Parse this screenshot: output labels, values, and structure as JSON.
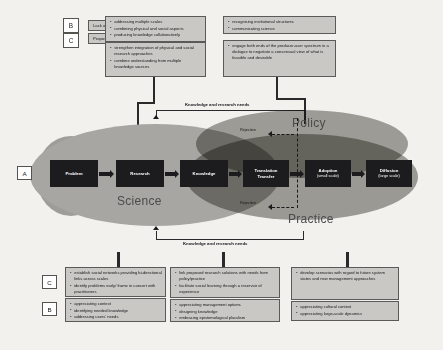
{
  "legend": {
    "rows": [
      {
        "letter": "B",
        "text": "Lack of..."
      },
      {
        "letter": "C",
        "text": "Proposed to..."
      }
    ]
  },
  "side_labels": {
    "a": "A",
    "c": "C",
    "b": "B"
  },
  "top_boxes": [
    {
      "id": "top-left-b",
      "items": [
        "addressing multiple scales",
        "combining physical and social aspects",
        "producing knowledge collaboratively"
      ]
    },
    {
      "id": "top-left-c",
      "items": [
        "strengthen integration of physical and social research approaches",
        "combine understanding from multiple knowledge sources"
      ]
    },
    {
      "id": "top-right-b",
      "items": [
        "recognising institutional structures",
        "communicating science"
      ]
    },
    {
      "id": "top-right-c",
      "items": [
        "engage both ends of the producer-user spectrum in a dialogue to negotiate a consensual view of what is feasible and desirable"
      ]
    }
  ],
  "bottom_boxes": [
    {
      "id": "bottom-1-c",
      "items": [
        "establish social networks providing bi-directional links across scales",
        "identify problems early/ frame in concert with practitioners"
      ]
    },
    {
      "id": "bottom-1-b",
      "items": [
        "appreciating context",
        "identifying needed knowledge",
        "addressing users' needs"
      ]
    },
    {
      "id": "bottom-2-c",
      "items": [
        "link proposed research solutions with needs from policy/practice",
        "facilitate social learning through a reservoir of experience"
      ]
    },
    {
      "id": "bottom-2-b",
      "items": [
        "appreciating management options",
        "designing knowledge",
        "embracing epistemological pluralism"
      ]
    },
    {
      "id": "bottom-3-c",
      "items": [
        "develop scenarios with regard to future system states and new management approaches"
      ]
    },
    {
      "id": "bottom-3-b",
      "items": [
        "appreciating cultural context",
        "appreciating large-scale dynamics"
      ]
    }
  ],
  "chain": [
    {
      "title": "Problem",
      "sub": ""
    },
    {
      "title": "Research",
      "sub": ""
    },
    {
      "title": "Knowledge",
      "sub": ""
    },
    {
      "title": "Translation",
      "sub": "Transfer"
    },
    {
      "title": "Adoption",
      "sub": "(small scale)"
    },
    {
      "title": "Diffusion",
      "sub": "(large scale)"
    }
  ],
  "regions": {
    "science": "Science",
    "policy": "Policy",
    "practice": "Practice"
  },
  "flow_labels": {
    "top_feedback": "Knowledge and research needs",
    "bottom_feedback": "Knowledge and research needs"
  },
  "rejection_labels": {
    "top": "Rejection",
    "bottom": "Rejection"
  },
  "colors": {
    "box_fill": "#c9c8c4",
    "box_border": "#5a5a58",
    "chain_fill": "#1c1c1e",
    "ellipse": "#a7a6a2",
    "background": "#f2f1ee"
  }
}
